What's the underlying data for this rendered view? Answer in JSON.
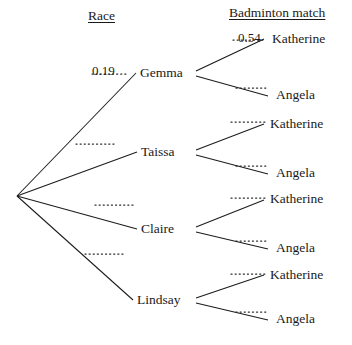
{
  "diagram": {
    "type": "probability-tree",
    "stages": [
      {
        "id": "race",
        "heading": "Race"
      },
      {
        "id": "badminton",
        "heading": "Badminton match"
      }
    ],
    "headings": {
      "stage1": "Race",
      "stage2": "Badminton match"
    },
    "stage1_nodes": [
      {
        "label": "Gemma",
        "probability": "0.19",
        "probability_shown": true
      },
      {
        "label": "Taissa",
        "probability": "",
        "probability_shown": false
      },
      {
        "label": "Claire",
        "probability": "",
        "probability_shown": false
      },
      {
        "label": "Lindsay",
        "probability": "",
        "probability_shown": false
      }
    ],
    "stage2_leaves": [
      {
        "parent": "Gemma",
        "label": "Katherine",
        "probability": "0.54",
        "probability_shown": true
      },
      {
        "parent": "Gemma",
        "label": "Angela",
        "probability": "",
        "probability_shown": false
      },
      {
        "parent": "Taissa",
        "label": "Katherine",
        "probability": "",
        "probability_shown": false
      },
      {
        "parent": "Taissa",
        "label": "Angela",
        "probability": "",
        "probability_shown": false
      },
      {
        "parent": "Claire",
        "label": "Katherine",
        "probability": "",
        "probability_shown": false
      },
      {
        "parent": "Claire",
        "label": "Angela",
        "probability": "",
        "probability_shown": false
      },
      {
        "parent": "Lindsay",
        "label": "Katherine",
        "probability": "",
        "probability_shown": false
      },
      {
        "parent": "Lindsay",
        "label": "Angela",
        "probability": "",
        "probability_shown": false
      }
    ],
    "labels": {
      "gemma": "Gemma",
      "taissa": "Taissa",
      "claire": "Claire",
      "lindsay": "Lindsay",
      "katherine": "Katherine",
      "angela": "Angela"
    },
    "values": {
      "race_gemma": "0.19",
      "gemma_katherine": "0.54"
    },
    "colors": {
      "ink": "#1a1a1a",
      "branch": "#1c1c1c",
      "background": "#ffffff"
    }
  }
}
